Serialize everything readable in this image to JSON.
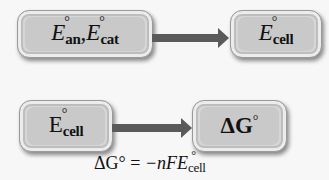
{
  "diagram": {
    "row1": {
      "from_box": {
        "symbol1": "E",
        "sub1": "an",
        "separator": ",",
        "symbol2": "E",
        "sub2": "cat",
        "degree": "°"
      },
      "to_box": {
        "symbol": "E",
        "sub": "cell",
        "degree": "°"
      }
    },
    "row2": {
      "from_box": {
        "symbol": "E",
        "sub": "cell",
        "degree": "°"
      },
      "to_box": {
        "symbol": "ΔG",
        "degree": "°"
      },
      "equation": {
        "lhs": "ΔG°",
        "equals": " = ",
        "rhs_prefix": "−nFE",
        "degree": "°",
        "rhs_sub": "cell"
      }
    }
  }
}
